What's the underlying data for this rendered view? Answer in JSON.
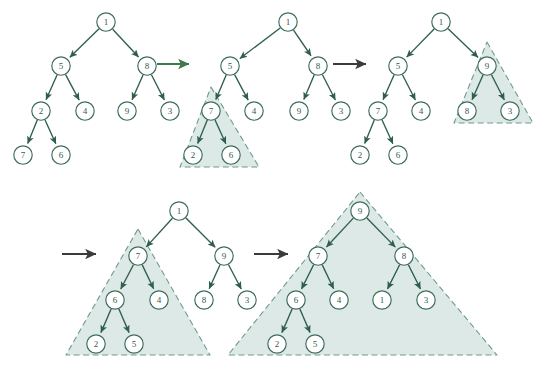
{
  "figure": {
    "title": "",
    "type": "diagram",
    "colors": {
      "node_stroke": "#3d6b5c",
      "node_fill": "#ffffff",
      "node_label": "#2f5d4e",
      "edge": "#2f5d4e",
      "region_fill": "#dde9e6",
      "region_stroke": "#6f9c8c",
      "transition_arrow_green": "#3f7a4e",
      "transition_arrow_dark": "#3b3b3b",
      "background": "#ffffff"
    }
  },
  "panels": [
    {
      "id": "panel-1",
      "name": "initial-tree",
      "nodes": [
        {
          "id": "p1n0",
          "label": "1",
          "x": 106,
          "y": 22
        },
        {
          "id": "p1n1",
          "label": "5",
          "x": 61,
          "y": 66
        },
        {
          "id": "p1n2",
          "label": "8",
          "x": 147,
          "y": 66
        },
        {
          "id": "p1n3",
          "label": "2",
          "x": 41,
          "y": 111
        },
        {
          "id": "p1n4",
          "label": "4",
          "x": 85,
          "y": 111
        },
        {
          "id": "p1n5",
          "label": "9",
          "x": 127,
          "y": 111
        },
        {
          "id": "p1n6",
          "label": "3",
          "x": 170,
          "y": 111
        },
        {
          "id": "p1n7",
          "label": "7",
          "x": 23,
          "y": 155
        },
        {
          "id": "p1n8",
          "label": "6",
          "x": 61,
          "y": 155
        }
      ],
      "edges": [
        {
          "from": "p1n0",
          "to": "p1n1"
        },
        {
          "from": "p1n0",
          "to": "p1n2"
        },
        {
          "from": "p1n1",
          "to": "p1n3"
        },
        {
          "from": "p1n1",
          "to": "p1n4"
        },
        {
          "from": "p1n2",
          "to": "p1n5"
        },
        {
          "from": "p1n2",
          "to": "p1n6"
        },
        {
          "from": "p1n3",
          "to": "p1n7"
        },
        {
          "from": "p1n3",
          "to": "p1n8"
        }
      ],
      "regions": []
    },
    {
      "id": "panel-2",
      "name": "heapify-subtree-7-2-6",
      "nodes": [
        {
          "id": "p2n0",
          "label": "1",
          "x": 288,
          "y": 22
        },
        {
          "id": "p2n1",
          "label": "5",
          "x": 230,
          "y": 66
        },
        {
          "id": "p2n2",
          "label": "8",
          "x": 318,
          "y": 66
        },
        {
          "id": "p2n3",
          "label": "7",
          "x": 211,
          "y": 111
        },
        {
          "id": "p2n4",
          "label": "4",
          "x": 254,
          "y": 111
        },
        {
          "id": "p2n5",
          "label": "9",
          "x": 299,
          "y": 111
        },
        {
          "id": "p2n6",
          "label": "3",
          "x": 341,
          "y": 111
        },
        {
          "id": "p2n7",
          "label": "2",
          "x": 193,
          "y": 155
        },
        {
          "id": "p2n8",
          "label": "6",
          "x": 231,
          "y": 155
        }
      ],
      "edges": [
        {
          "from": "p2n0",
          "to": "p2n1"
        },
        {
          "from": "p2n0",
          "to": "p2n2"
        },
        {
          "from": "p2n1",
          "to": "p2n3"
        },
        {
          "from": "p2n1",
          "to": "p2n4"
        },
        {
          "from": "p2n2",
          "to": "p2n5"
        },
        {
          "from": "p2n2",
          "to": "p2n6"
        },
        {
          "from": "p2n3",
          "to": "p2n7"
        },
        {
          "from": "p2n3",
          "to": "p2n8"
        }
      ],
      "regions": [
        {
          "id": "p2r0",
          "name": "highlight-triangle",
          "apex_x": 211,
          "apex_y": 87,
          "base_y": 167,
          "left_x": 180,
          "right_x": 259
        }
      ]
    },
    {
      "id": "panel-3",
      "name": "heapify-subtree-9-8-3",
      "nodes": [
        {
          "id": "p3n0",
          "label": "1",
          "x": 441,
          "y": 22
        },
        {
          "id": "p3n1",
          "label": "5",
          "x": 398,
          "y": 66
        },
        {
          "id": "p3n2",
          "label": "9",
          "x": 487,
          "y": 66
        },
        {
          "id": "p3n3",
          "label": "7",
          "x": 378,
          "y": 111
        },
        {
          "id": "p3n4",
          "label": "4",
          "x": 421,
          "y": 111
        },
        {
          "id": "p3n5",
          "label": "8",
          "x": 467,
          "y": 111
        },
        {
          "id": "p3n6",
          "label": "3",
          "x": 510,
          "y": 111
        },
        {
          "id": "p3n7",
          "label": "2",
          "x": 360,
          "y": 155
        },
        {
          "id": "p3n8",
          "label": "6",
          "x": 398,
          "y": 155
        }
      ],
      "edges": [
        {
          "from": "p3n0",
          "to": "p3n1"
        },
        {
          "from": "p3n0",
          "to": "p3n2"
        },
        {
          "from": "p3n1",
          "to": "p3n3"
        },
        {
          "from": "p3n1",
          "to": "p3n4"
        },
        {
          "from": "p3n2",
          "to": "p3n5"
        },
        {
          "from": "p3n2",
          "to": "p3n6"
        },
        {
          "from": "p3n3",
          "to": "p3n7"
        },
        {
          "from": "p3n3",
          "to": "p3n8"
        }
      ],
      "regions": [
        {
          "id": "p3r0",
          "name": "highlight-triangle",
          "apex_x": 487,
          "apex_y": 42,
          "base_y": 123,
          "left_x": 454,
          "right_x": 533
        }
      ]
    },
    {
      "id": "panel-4",
      "name": "heapify-left-subtree-7",
      "nodes": [
        {
          "id": "p4n0",
          "label": "1",
          "x": 179,
          "y": 211
        },
        {
          "id": "p4n1",
          "label": "7",
          "x": 138,
          "y": 256
        },
        {
          "id": "p4n2",
          "label": "9",
          "x": 224,
          "y": 256
        },
        {
          "id": "p4n3",
          "label": "6",
          "x": 115,
          "y": 300
        },
        {
          "id": "p4n4",
          "label": "4",
          "x": 159,
          "y": 300
        },
        {
          "id": "p4n5",
          "label": "8",
          "x": 204,
          "y": 300
        },
        {
          "id": "p4n6",
          "label": "3",
          "x": 247,
          "y": 300
        },
        {
          "id": "p4n7",
          "label": "2",
          "x": 96,
          "y": 344
        },
        {
          "id": "p4n8",
          "label": "5",
          "x": 134,
          "y": 344
        }
      ],
      "edges": [
        {
          "from": "p4n0",
          "to": "p4n1"
        },
        {
          "from": "p4n0",
          "to": "p4n2"
        },
        {
          "from": "p4n1",
          "to": "p4n3"
        },
        {
          "from": "p4n1",
          "to": "p4n4"
        },
        {
          "from": "p4n2",
          "to": "p4n5"
        },
        {
          "from": "p4n2",
          "to": "p4n6"
        },
        {
          "from": "p4n3",
          "to": "p4n7"
        },
        {
          "from": "p4n3",
          "to": "p4n8"
        }
      ],
      "regions": [
        {
          "id": "p4r0",
          "name": "highlight-triangle",
          "apex_x": 138,
          "apex_y": 229,
          "base_y": 355,
          "left_x": 66,
          "right_x": 210
        }
      ]
    },
    {
      "id": "panel-5",
      "name": "final-max-heap",
      "nodes": [
        {
          "id": "p5n0",
          "label": "9",
          "x": 360,
          "y": 211
        },
        {
          "id": "p5n1",
          "label": "7",
          "x": 318,
          "y": 256
        },
        {
          "id": "p5n2",
          "label": "8",
          "x": 404,
          "y": 256
        },
        {
          "id": "p5n3",
          "label": "6",
          "x": 296,
          "y": 300
        },
        {
          "id": "p5n4",
          "label": "4",
          "x": 339,
          "y": 300
        },
        {
          "id": "p5n5",
          "label": "1",
          "x": 382,
          "y": 300
        },
        {
          "id": "p5n6",
          "label": "3",
          "x": 426,
          "y": 300
        },
        {
          "id": "p5n7",
          "label": "2",
          "x": 277,
          "y": 344
        },
        {
          "id": "p5n8",
          "label": "5",
          "x": 315,
          "y": 344
        }
      ],
      "edges": [
        {
          "from": "p5n0",
          "to": "p5n1"
        },
        {
          "from": "p5n0",
          "to": "p5n2"
        },
        {
          "from": "p5n1",
          "to": "p5n3"
        },
        {
          "from": "p5n1",
          "to": "p5n4"
        },
        {
          "from": "p5n2",
          "to": "p5n5"
        },
        {
          "from": "p5n2",
          "to": "p5n6"
        },
        {
          "from": "p5n3",
          "to": "p5n7"
        },
        {
          "from": "p5n3",
          "to": "p5n8"
        }
      ],
      "regions": [
        {
          "id": "p5r0",
          "name": "highlight-triangle",
          "apex_x": 360,
          "apex_y": 192,
          "base_y": 355,
          "left_x": 228,
          "right_x": 497
        }
      ]
    }
  ],
  "transitions": [
    {
      "id": "t1",
      "name": "transition-arrow-1",
      "x1": 157,
      "y1": 64,
      "x2": 189,
      "y2": 64,
      "color": "#3f7a4e"
    },
    {
      "id": "t2",
      "name": "transition-arrow-2",
      "x1": 333,
      "y1": 64,
      "x2": 366,
      "y2": 64,
      "color": "#3b3b3b"
    },
    {
      "id": "t3",
      "name": "transition-arrow-3",
      "x1": 62,
      "y1": 254,
      "x2": 96,
      "y2": 254,
      "color": "#3b3b3b"
    },
    {
      "id": "t4",
      "name": "transition-arrow-4",
      "x1": 254,
      "y1": 254,
      "x2": 288,
      "y2": 254,
      "color": "#3b3b3b"
    }
  ]
}
